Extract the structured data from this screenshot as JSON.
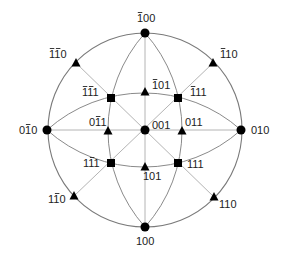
{
  "diagram": {
    "type": "stereographic-projection",
    "center": [
      145,
      130
    ],
    "radius": 97,
    "colors": {
      "primitive": "#7a7a7a",
      "arc": "#8a8a8a",
      "diameter": "#b4b4b4",
      "marker": "#000000"
    },
    "points": [
      {
        "id": "p-100top",
        "label": "1̄00",
        "base": "100",
        "bar": [
          0
        ],
        "shape": "circle",
        "x": 145,
        "y": 33,
        "lx": 137,
        "ly": 22
      },
      {
        "id": "p-100",
        "label": "100",
        "base": "100",
        "bar": [],
        "shape": "circle",
        "x": 145,
        "y": 227,
        "lx": 136,
        "ly": 245
      },
      {
        "id": "p-0-10",
        "label": "01̄0",
        "base": "010",
        "bar": [
          1
        ],
        "shape": "circle",
        "x": 47,
        "y": 130,
        "lx": 19,
        "ly": 134
      },
      {
        "id": "p-010",
        "label": "010",
        "base": "010",
        "bar": [],
        "shape": "circle",
        "x": 241,
        "y": 130,
        "lx": 251,
        "ly": 134
      },
      {
        "id": "p-001",
        "label": "001",
        "base": "001",
        "bar": [],
        "shape": "circle",
        "x": 145,
        "y": 130,
        "lx": 152,
        "ly": 129
      },
      {
        "id": "p--1-10",
        "label": "1̄1̄0",
        "base": "110",
        "bar": [
          0,
          1
        ],
        "shape": "triangle",
        "x": 76,
        "y": 63,
        "lx": 49,
        "ly": 58
      },
      {
        "id": "p--110",
        "label": "1̄10",
        "base": "110",
        "bar": [
          0
        ],
        "shape": "triangle",
        "x": 213,
        "y": 63,
        "lx": 220,
        "ly": 58
      },
      {
        "id": "p-1-10",
        "label": "11̄0",
        "base": "110",
        "bar": [
          1
        ],
        "shape": "triangle",
        "x": 74,
        "y": 196,
        "lx": 48,
        "ly": 203
      },
      {
        "id": "p-110",
        "label": "110",
        "base": "110",
        "bar": [],
        "shape": "triangle",
        "x": 214,
        "y": 197,
        "lx": 219,
        "ly": 208
      },
      {
        "id": "p--101",
        "label": "1̄01",
        "base": "101",
        "bar": [
          0
        ],
        "shape": "triangle",
        "x": 145,
        "y": 92,
        "lx": 152,
        "ly": 89
      },
      {
        "id": "p-101",
        "label": "101",
        "base": "101",
        "bar": [],
        "shape": "triangle",
        "x": 145,
        "y": 167,
        "lx": 143,
        "ly": 180
      },
      {
        "id": "p-0-11",
        "label": "01̄1",
        "base": "011",
        "bar": [
          1
        ],
        "shape": "triangle",
        "x": 108,
        "y": 131,
        "lx": 89,
        "ly": 126
      },
      {
        "id": "p-011",
        "label": "011",
        "base": "011",
        "bar": [],
        "shape": "triangle",
        "x": 182,
        "y": 131,
        "lx": 185,
        "ly": 126
      },
      {
        "id": "p--1-11",
        "label": "1̄1̄1",
        "base": "111",
        "bar": [
          0,
          1
        ],
        "shape": "square",
        "x": 111,
        "y": 98,
        "lx": 82,
        "ly": 96
      },
      {
        "id": "p--111",
        "label": "1̄11",
        "base": "111",
        "bar": [
          0
        ],
        "shape": "square",
        "x": 178,
        "y": 98,
        "lx": 190,
        "ly": 96
      },
      {
        "id": "p-1-11",
        "label": "11̄1",
        "base": "111",
        "bar": [
          1
        ],
        "shape": "square",
        "x": 111,
        "y": 163,
        "lx": 83,
        "ly": 167
      },
      {
        "id": "p-111",
        "label": "111",
        "base": "111",
        "bar": [],
        "shape": "square",
        "x": 178,
        "y": 163,
        "lx": 187,
        "ly": 168
      }
    ]
  }
}
